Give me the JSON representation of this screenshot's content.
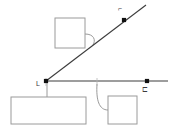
{
  "canvas": {
    "width": 173,
    "height": 134,
    "background_color": "#ffffff"
  },
  "colors": {
    "line_stroke": "#3c3c3c",
    "box_stroke": "#9a9a9a",
    "leader_stroke": "#9a9a9a",
    "point_fill": "#111111",
    "tick_mark": "#4a4a4a",
    "box_fill": "#ffffff"
  },
  "diagram": {
    "type": "geometry-annotation",
    "lines": [
      {
        "name": "horizontal-line",
        "x1": 46,
        "y1": 81,
        "x2": 168,
        "y2": 81
      },
      {
        "name": "diagonal-ray",
        "x1": 46,
        "y1": 81,
        "x2": 146,
        "y2": 5
      }
    ],
    "points": [
      {
        "name": "vertex-point",
        "cx": 46,
        "cy": 81,
        "r": 2.1,
        "label": "L",
        "label_x": 36,
        "label_y": 84
      },
      {
        "name": "diagonal-point",
        "cx": 124,
        "cy": 20,
        "r": 2.1,
        "label": "⌐",
        "label_x": 118,
        "label_y": 9
      },
      {
        "name": "horizontal-point",
        "cx": 147,
        "cy": 81,
        "r": 2.1,
        "label": "⊏",
        "label_x": 142,
        "label_y": 90
      }
    ],
    "callouts": [
      {
        "name": "upper-callout-box",
        "x": 55,
        "y": 18,
        "width": 30,
        "height": 30,
        "text": ""
      },
      {
        "name": "lower-left-callout-box",
        "x": 11,
        "y": 97,
        "width": 75,
        "height": 27,
        "text": ""
      },
      {
        "name": "lower-right-callout-box",
        "x": 108,
        "y": 96,
        "width": 29,
        "height": 28,
        "text": ""
      }
    ],
    "leaders": [
      {
        "name": "upper-leader-line",
        "path": "M 85 34 C 94 34 96 40 93 45"
      },
      {
        "name": "lower-left-leader-line",
        "path": "M 47 83 L 47 97"
      },
      {
        "name": "lower-right-leader-line",
        "path": "M 108 110 C 99 110 96 100 97 84"
      }
    ],
    "ticks": [
      {
        "name": "vertex-tick",
        "x1": 46,
        "y1": 78,
        "x2": 46,
        "y2": 86
      },
      {
        "name": "midpoint-tick",
        "x1": 97,
        "y1": 78,
        "x2": 97,
        "y2": 86
      }
    ]
  }
}
